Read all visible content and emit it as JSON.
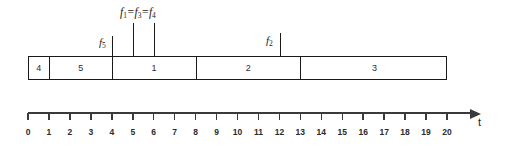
{
  "chart_data": {
    "type": "bar",
    "title": "",
    "subtitle": "",
    "xlabel": "t",
    "ylabel": "",
    "xlim": [
      0,
      20
    ],
    "grid": false,
    "legend_position": "none",
    "orientation": "horizontal-timeline",
    "categories": [
      "4",
      "5",
      "1",
      "2",
      "3"
    ],
    "segments": [
      {
        "label": "4",
        "start": 0,
        "end": 1,
        "duration": 1
      },
      {
        "label": "5",
        "start": 1,
        "end": 4,
        "duration": 3
      },
      {
        "label": "1",
        "start": 4,
        "end": 8,
        "duration": 4
      },
      {
        "label": "2",
        "start": 8,
        "end": 13,
        "duration": 5
      },
      {
        "label": "3",
        "start": 13,
        "end": 20,
        "duration": 7
      }
    ],
    "values": [
      1,
      3,
      4,
      5,
      7
    ],
    "axis": {
      "name": "t",
      "min": 0,
      "max": 20,
      "tick_step": 1,
      "tick_labels": [
        "0",
        "1",
        "2",
        "3",
        "4",
        "5",
        "6",
        "7",
        "8",
        "9",
        "10",
        "11",
        "12",
        "13",
        "14",
        "15",
        "16",
        "17",
        "18",
        "19",
        "20"
      ]
    },
    "annotations": [
      {
        "id": "f5",
        "text": "f",
        "sub": "5",
        "at": 4,
        "line_height": "short",
        "label_side": "left"
      },
      {
        "id": "f134",
        "text": "f",
        "sub": "1",
        "at": 5,
        "line_height": "tall",
        "label_side": "group"
      },
      {
        "id": "f134b",
        "text": "f",
        "sub": "3",
        "at": 6,
        "line_height": "tall",
        "label_side": "group"
      },
      {
        "id": "f2",
        "text": "f",
        "sub": "2",
        "at": 12,
        "line_height": "short",
        "label_side": "left"
      }
    ],
    "group_annotation": {
      "parts": [
        {
          "base": "f",
          "sub": "1"
        },
        {
          "base": "f",
          "sub": "3"
        },
        {
          "base": "f",
          "sub": "4"
        }
      ],
      "separator": "=",
      "text": "f1 = f3 = f4",
      "covers": [
        5,
        6
      ]
    }
  },
  "markers": {
    "f5": {
      "base": "f",
      "sub": "5"
    },
    "f2": {
      "base": "f",
      "sub": "2"
    }
  },
  "colors": {
    "ink": "#1a1a1a",
    "axis": "#3a3a3a",
    "background": "#ffffff",
    "segment_text": "#2b2b2b"
  }
}
